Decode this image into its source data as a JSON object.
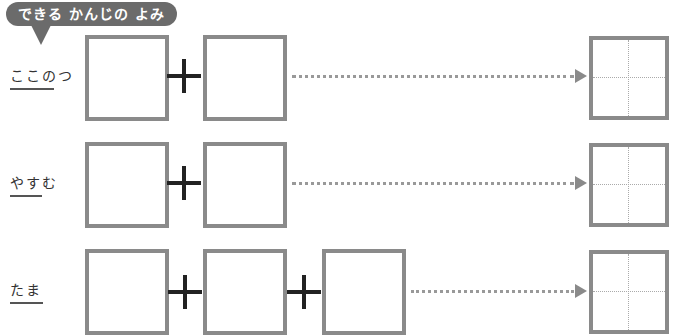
{
  "header": {
    "badge_label": "できる かんじの よみ"
  },
  "rows": [
    {
      "reading": "ここのつ",
      "underline_chars": 3,
      "part_boxes": 2
    },
    {
      "reading": "やすむ",
      "underline_chars": 2,
      "part_boxes": 2
    },
    {
      "reading": "たま",
      "underline_chars": 2,
      "part_boxes": 3
    }
  ],
  "colors": {
    "badge": "#6b6b6b",
    "box_border": "#8a8a8a",
    "plus": "#222222",
    "dots": "#999999"
  },
  "icons": {
    "plus": "plus-icon",
    "arrow": "arrow-right-icon"
  }
}
